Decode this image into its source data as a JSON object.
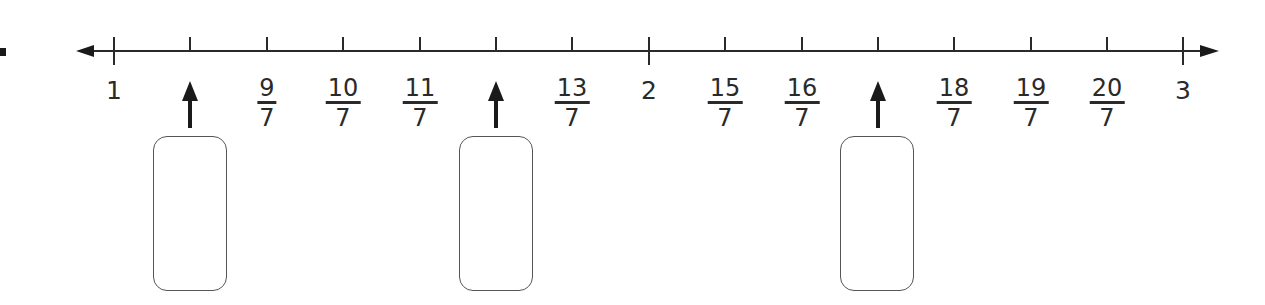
{
  "question": {
    "number_mark": "partial question-number glyph (cropped at left edge)"
  },
  "number_line": {
    "start": 1,
    "end": 3,
    "denominator": 7,
    "arrows": "both ends",
    "line_color": "#2a2a2a",
    "ticks": [
      {
        "value": "1",
        "kind": "whole",
        "label": "1"
      },
      {
        "value": "8/7",
        "kind": "blank",
        "label": ""
      },
      {
        "value": "9/7",
        "kind": "fraction",
        "numerator": "9",
        "denominator": "7"
      },
      {
        "value": "10/7",
        "kind": "fraction",
        "numerator": "10",
        "denominator": "7"
      },
      {
        "value": "11/7",
        "kind": "fraction",
        "numerator": "11",
        "denominator": "7"
      },
      {
        "value": "12/7",
        "kind": "blank",
        "label": ""
      },
      {
        "value": "13/7",
        "kind": "fraction",
        "numerator": "13",
        "denominator": "7"
      },
      {
        "value": "2",
        "kind": "whole",
        "label": "2"
      },
      {
        "value": "15/7",
        "kind": "fraction",
        "numerator": "15",
        "denominator": "7"
      },
      {
        "value": "16/7",
        "kind": "fraction",
        "numerator": "16",
        "denominator": "7"
      },
      {
        "value": "17/7",
        "kind": "blank",
        "label": ""
      },
      {
        "value": "18/7",
        "kind": "fraction",
        "numerator": "18",
        "denominator": "7"
      },
      {
        "value": "19/7",
        "kind": "fraction",
        "numerator": "19",
        "denominator": "7"
      },
      {
        "value": "20/7",
        "kind": "fraction",
        "numerator": "20",
        "denominator": "7"
      },
      {
        "value": "3",
        "kind": "whole",
        "label": "3"
      }
    ]
  },
  "answer_boxes": [
    {
      "points_to": "8/7",
      "value": ""
    },
    {
      "points_to": "12/7",
      "value": ""
    },
    {
      "points_to": "17/7",
      "value": ""
    }
  ]
}
